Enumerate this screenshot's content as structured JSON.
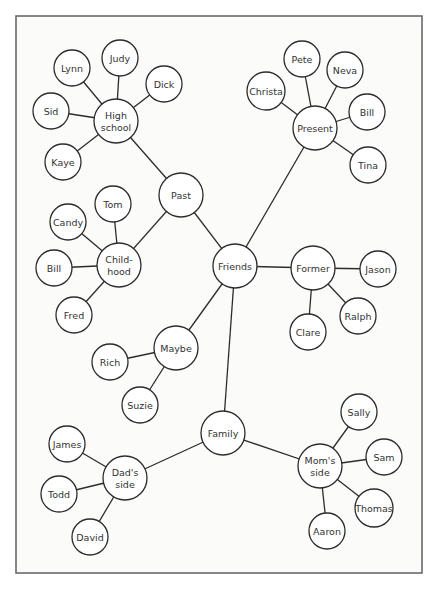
{
  "diagram": {
    "type": "mind-map",
    "center": "Friends",
    "frame": {
      "x": 16,
      "y": 16,
      "width": 406,
      "height": 557
    },
    "nodes": [
      {
        "id": "friends",
        "label": "Friends",
        "x": 235,
        "y": 266,
        "r": 22
      },
      {
        "id": "past",
        "label": "Past",
        "x": 181,
        "y": 195,
        "r": 22
      },
      {
        "id": "present",
        "label": "Present",
        "x": 315,
        "y": 128,
        "r": 22
      },
      {
        "id": "former",
        "label": "Former",
        "x": 313,
        "y": 268,
        "r": 22
      },
      {
        "id": "maybe",
        "label": "Maybe",
        "x": 176,
        "y": 348,
        "r": 22
      },
      {
        "id": "family",
        "label": "Family",
        "x": 223,
        "y": 433,
        "r": 22
      },
      {
        "id": "highschool",
        "label": [
          "High",
          "school"
        ],
        "x": 116,
        "y": 121,
        "r": 22
      },
      {
        "id": "judy",
        "label": "Judy",
        "x": 120,
        "y": 58,
        "r": 18
      },
      {
        "id": "lynn",
        "label": "Lynn",
        "x": 72,
        "y": 68,
        "r": 18
      },
      {
        "id": "dick",
        "label": "Dick",
        "x": 164,
        "y": 84,
        "r": 18
      },
      {
        "id": "sid",
        "label": "Sid",
        "x": 51,
        "y": 111,
        "r": 18
      },
      {
        "id": "kaye",
        "label": "Kaye",
        "x": 63,
        "y": 162,
        "r": 18
      },
      {
        "id": "childhood",
        "label": [
          "Child-",
          "hood"
        ],
        "x": 119,
        "y": 265,
        "r": 22
      },
      {
        "id": "tom",
        "label": "Tom",
        "x": 113,
        "y": 204,
        "r": 18
      },
      {
        "id": "candy",
        "label": "Candy",
        "x": 68,
        "y": 222,
        "r": 18
      },
      {
        "id": "bill1",
        "label": "Bill",
        "x": 54,
        "y": 268,
        "r": 18
      },
      {
        "id": "fred",
        "label": "Fred",
        "x": 74,
        "y": 315,
        "r": 18
      },
      {
        "id": "pete",
        "label": "Pete",
        "x": 302,
        "y": 59,
        "r": 18
      },
      {
        "id": "neva",
        "label": "Neva",
        "x": 345,
        "y": 70,
        "r": 18
      },
      {
        "id": "christa",
        "label": "Christa",
        "x": 266,
        "y": 91,
        "r": 19
      },
      {
        "id": "bill2",
        "label": "Bill",
        "x": 367,
        "y": 112,
        "r": 18
      },
      {
        "id": "tina",
        "label": "Tina",
        "x": 368,
        "y": 165,
        "r": 18
      },
      {
        "id": "jason",
        "label": "Jason",
        "x": 378,
        "y": 269,
        "r": 18
      },
      {
        "id": "ralph",
        "label": "Ralph",
        "x": 358,
        "y": 316,
        "r": 18
      },
      {
        "id": "clare",
        "label": "Clare",
        "x": 308,
        "y": 332,
        "r": 18
      },
      {
        "id": "rich",
        "label": "Rich",
        "x": 110,
        "y": 362,
        "r": 18
      },
      {
        "id": "suzie",
        "label": "Suzie",
        "x": 140,
        "y": 405,
        "r": 18
      },
      {
        "id": "dadsside",
        "label": [
          "Dad's",
          "side"
        ],
        "x": 125,
        "y": 478,
        "r": 22
      },
      {
        "id": "james",
        "label": "James",
        "x": 67,
        "y": 444,
        "r": 18
      },
      {
        "id": "todd",
        "label": "Todd",
        "x": 59,
        "y": 494,
        "r": 18
      },
      {
        "id": "david",
        "label": "David",
        "x": 90,
        "y": 537,
        "r": 18
      },
      {
        "id": "momsside",
        "label": [
          "Mom's",
          "side"
        ],
        "x": 320,
        "y": 466,
        "r": 22
      },
      {
        "id": "sally",
        "label": "Sally",
        "x": 359,
        "y": 412,
        "r": 18
      },
      {
        "id": "sam",
        "label": "Sam",
        "x": 384,
        "y": 457,
        "r": 18
      },
      {
        "id": "thomas",
        "label": "Thomas",
        "x": 374,
        "y": 508,
        "r": 19
      },
      {
        "id": "aaron",
        "label": "Aaron",
        "x": 327,
        "y": 531,
        "r": 18
      }
    ],
    "edges": [
      [
        "friends",
        "past"
      ],
      [
        "friends",
        "present"
      ],
      [
        "friends",
        "former"
      ],
      [
        "friends",
        "maybe"
      ],
      [
        "friends",
        "family"
      ],
      [
        "past",
        "highschool"
      ],
      [
        "past",
        "childhood"
      ],
      [
        "highschool",
        "judy"
      ],
      [
        "highschool",
        "lynn"
      ],
      [
        "highschool",
        "dick"
      ],
      [
        "highschool",
        "sid"
      ],
      [
        "highschool",
        "kaye"
      ],
      [
        "childhood",
        "tom"
      ],
      [
        "childhood",
        "candy"
      ],
      [
        "childhood",
        "bill1"
      ],
      [
        "childhood",
        "fred"
      ],
      [
        "present",
        "pete"
      ],
      [
        "present",
        "neva"
      ],
      [
        "present",
        "christa"
      ],
      [
        "present",
        "bill2"
      ],
      [
        "present",
        "tina"
      ],
      [
        "former",
        "jason"
      ],
      [
        "former",
        "ralph"
      ],
      [
        "former",
        "clare"
      ],
      [
        "maybe",
        "rich"
      ],
      [
        "maybe",
        "suzie"
      ],
      [
        "family",
        "dadsside"
      ],
      [
        "family",
        "momsside"
      ],
      [
        "dadsside",
        "james"
      ],
      [
        "dadsside",
        "todd"
      ],
      [
        "dadsside",
        "david"
      ],
      [
        "momsside",
        "sally"
      ],
      [
        "momsside",
        "sam"
      ],
      [
        "momsside",
        "thomas"
      ],
      [
        "momsside",
        "aaron"
      ]
    ]
  }
}
